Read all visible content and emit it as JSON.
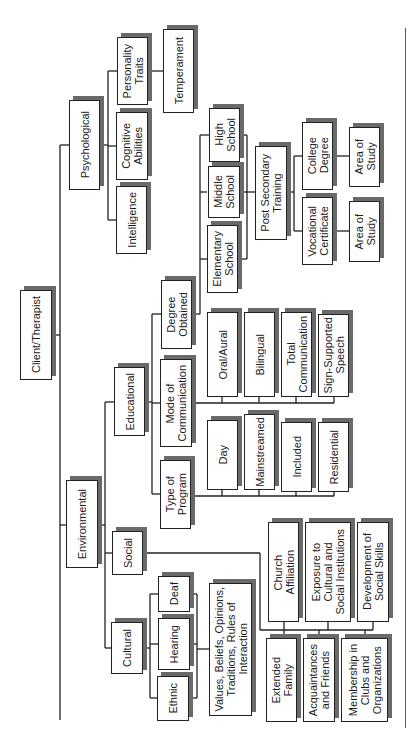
{
  "diagram": {
    "orientation": "rotated-90-ccw",
    "root": "Client/Therapist",
    "nodes": {
      "client_therapist": "Client/Therapist",
      "psychological": "Psychological",
      "personality_traits": "Personality\nTraits",
      "cognitive_abilities": "Cognitive\nAbilities",
      "intelligence": "Intelligence",
      "temperament": "Temperament",
      "environmental": "Environmental",
      "educational": "Educational",
      "social": "Social",
      "cultural": "Cultural",
      "degree_obtained": "Degree\nObtained",
      "mode_of_communication": "Mode of\nCommunication",
      "type_of_program": "Type of\nProgram",
      "day": "Day",
      "mainstreamed": "Mainstreamed",
      "included": "Included",
      "residential": "Residential",
      "oral_aural": "Oral/Aural",
      "bilingual": "Bilingual",
      "total_communication": "Total\nCommunication",
      "sign_supported_speech": "Sign-Supported\nSpeech",
      "elementary_school": "Elementary\nSchool",
      "middle_school": "Middle\nSchool",
      "high_school": "High\nSchool",
      "post_secondary_training": "Post Secondary\nTraining",
      "college_degree": "College\nDegree",
      "vocational_certificate": "Vocational\nCertificate",
      "area_of_study_college": "Area of\nStudy",
      "area_of_study_vocational": "Area of\nStudy",
      "deaf": "Deaf",
      "hearing": "Hearing",
      "ethnic": "Ethnic",
      "values_beliefs": "Values, Beliefs, Opinions,\nTraditions, Rules of\nInteraction",
      "church_affiliation": "Church\nAffiliation",
      "exposure_institutions": "Exposure to\nCultural and\nSocial Institutions",
      "development_social_skills": "Development of\nSocial Skills",
      "extended_family": "Extended\nFamily",
      "acquaintances_friends": "Acquaintances\nand Friends",
      "membership_clubs": "Membership in\nClubs and\nOrganizations"
    },
    "hierarchy": {
      "Client/Therapist": [
        "Psychological",
        "Environmental"
      ],
      "Psychological": [
        "Personality Traits",
        "Cognitive Abilities",
        "Intelligence"
      ],
      "Personality Traits": [
        "Temperament"
      ],
      "Environmental": [
        "Educational",
        "Social",
        "Cultural"
      ],
      "Educational": [
        "Degree Obtained",
        "Mode of Communication",
        "Type of Program"
      ],
      "Degree Obtained": [
        "Elementary School",
        "Middle School",
        "High School",
        "Post Secondary Training"
      ],
      "Post Secondary Training": [
        "College Degree",
        "Vocational Certificate"
      ],
      "College Degree": [
        "Area of Study"
      ],
      "Vocational Certificate": [
        "Area of Study"
      ],
      "Mode of Communication": [
        "Oral/Aural",
        "Bilingual",
        "Total Communication",
        "Sign-Supported Speech"
      ],
      "Type of Program": [
        "Day",
        "Mainstreamed",
        "Included",
        "Residential"
      ],
      "Cultural": [
        "Deaf",
        "Hearing",
        "Ethnic"
      ],
      "Deaf/Hearing/Ethnic": [
        "Values, Beliefs, Opinions, Traditions, Rules of Interaction"
      ],
      "Social": [
        "Church Affiliation",
        "Exposure to Cultural and Social Institutions",
        "Development of Social Skills",
        "Extended Family",
        "Acquaintances and Friends",
        "Membership in Clubs and Organizations"
      ]
    },
    "colors": {
      "border": "#222222",
      "shadow": "#6a6a6a",
      "line": "#222222",
      "background": "#ffffff"
    }
  }
}
